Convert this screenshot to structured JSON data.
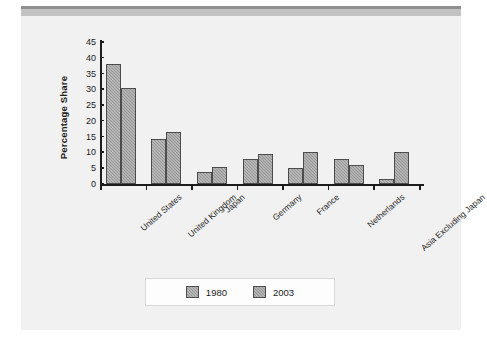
{
  "figure": {
    "background_color": "#f1f1f1",
    "header_band_color": "#8f8f8f"
  },
  "chart_data": {
    "type": "bar",
    "title": "",
    "xlabel": "",
    "ylabel": "Percentage Share",
    "ylim": [
      0,
      45
    ],
    "ytick_values": [
      45,
      40,
      35,
      30,
      25,
      20,
      15,
      10,
      5,
      0
    ],
    "ytick_labels": [
      "45",
      "40",
      "35",
      "30",
      "25",
      "20",
      "15",
      "10",
      "5",
      "0"
    ],
    "grid": false,
    "legend_position": "bottom-center",
    "categories": [
      "United States",
      "United Kingdom",
      "Japan",
      "Germany",
      "France",
      "Netherlands",
      "Asia Excluding Japan"
    ],
    "series": [
      {
        "name": "1980",
        "color": "#9d9d9d",
        "values": [
          38.0,
          14.3,
          3.7,
          8.0,
          5.0,
          7.8,
          1.7
        ]
      },
      {
        "name": "2003",
        "color": "#9a9a9a",
        "values": [
          30.3,
          16.6,
          5.3,
          9.4,
          10.0,
          6.0,
          10.0
        ]
      }
    ]
  },
  "legend": {
    "entries": [
      {
        "label": "1980"
      },
      {
        "label": "2003"
      }
    ]
  }
}
